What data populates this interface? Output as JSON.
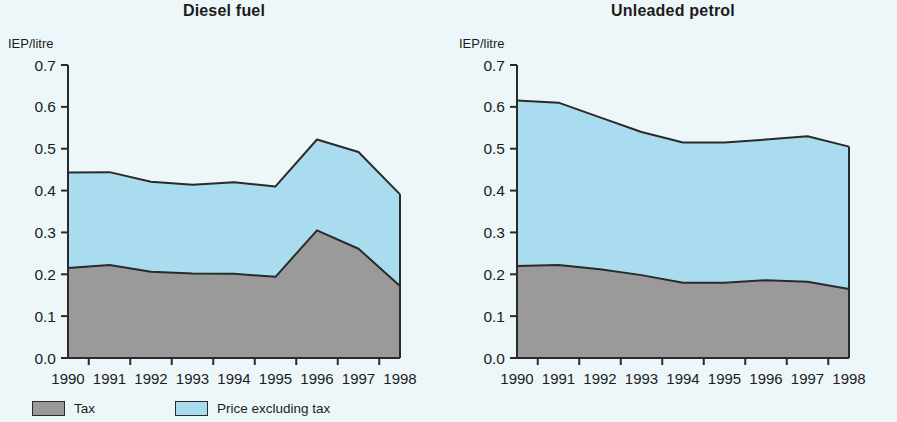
{
  "figure": {
    "background_color": "#edf7fa",
    "tax_color": "#9a9a9a",
    "price_color": "#a8dcee",
    "line_color": "#2a2a2a"
  },
  "legend": {
    "items": [
      {
        "label": "Tax",
        "color": "#9a9a9a",
        "name": "tax"
      },
      {
        "label": "Price excluding tax",
        "color": "#a8dcee",
        "name": "price-excluding-tax"
      }
    ]
  },
  "chart_data": [
    {
      "type": "area",
      "title": "Diesel fuel",
      "xlabel": "",
      "ylabel": "IEP/litre",
      "x": [
        1990,
        1991,
        1992,
        1993,
        1994,
        1995,
        1996,
        1997,
        1998
      ],
      "categories": [
        "1990",
        "1991",
        "1992",
        "1993",
        "1994",
        "1995",
        "1996",
        "1997",
        "1998"
      ],
      "ylim": [
        0.0,
        0.7
      ],
      "yticks": [
        0.0,
        0.1,
        0.2,
        0.3,
        0.4,
        0.5,
        0.6,
        0.7
      ],
      "ytick_labels": [
        "0.0",
        "0.1",
        "0.2",
        "0.3",
        "0.4",
        "0.5",
        "0.6",
        "0.7"
      ],
      "grid": false,
      "legend_position": "below-figure",
      "stacked": true,
      "series": [
        {
          "name": "Tax",
          "color": "#9a9a9a",
          "values": [
            0.215,
            0.222,
            0.206,
            0.202,
            0.201,
            0.194,
            0.305,
            0.261,
            0.172
          ]
        },
        {
          "name": "Price excluding tax",
          "color": "#a8dcee",
          "values": [
            0.228,
            0.222,
            0.215,
            0.212,
            0.219,
            0.216,
            0.217,
            0.231,
            0.219
          ]
        }
      ],
      "totals": [
        0.443,
        0.444,
        0.421,
        0.414,
        0.42,
        0.41,
        0.522,
        0.492,
        0.391
      ]
    },
    {
      "type": "area",
      "title": "Unleaded petrol",
      "xlabel": "",
      "ylabel": "IEP/litre",
      "x": [
        1990,
        1991,
        1992,
        1993,
        1994,
        1995,
        1996,
        1997,
        1998
      ],
      "categories": [
        "1990",
        "1991",
        "1992",
        "1993",
        "1994",
        "1995",
        "1996",
        "1997",
        "1998"
      ],
      "ylim": [
        0.0,
        0.7
      ],
      "yticks": [
        0.0,
        0.1,
        0.2,
        0.3,
        0.4,
        0.5,
        0.6,
        0.7
      ],
      "ytick_labels": [
        "0.0",
        "0.1",
        "0.2",
        "0.3",
        "0.4",
        "0.5",
        "0.6",
        "0.7"
      ],
      "grid": false,
      "legend_position": "below-figure",
      "stacked": true,
      "series": [
        {
          "name": "Tax",
          "color": "#9a9a9a",
          "values": [
            0.22,
            0.222,
            0.212,
            0.198,
            0.18,
            0.18,
            0.186,
            0.182,
            0.165
          ]
        },
        {
          "name": "Price excluding tax",
          "color": "#a8dcee",
          "values": [
            0.395,
            0.388,
            0.363,
            0.342,
            0.335,
            0.335,
            0.336,
            0.348,
            0.34
          ]
        }
      ],
      "totals": [
        0.615,
        0.61,
        0.575,
        0.54,
        0.515,
        0.515,
        0.522,
        0.53,
        0.505
      ]
    }
  ]
}
